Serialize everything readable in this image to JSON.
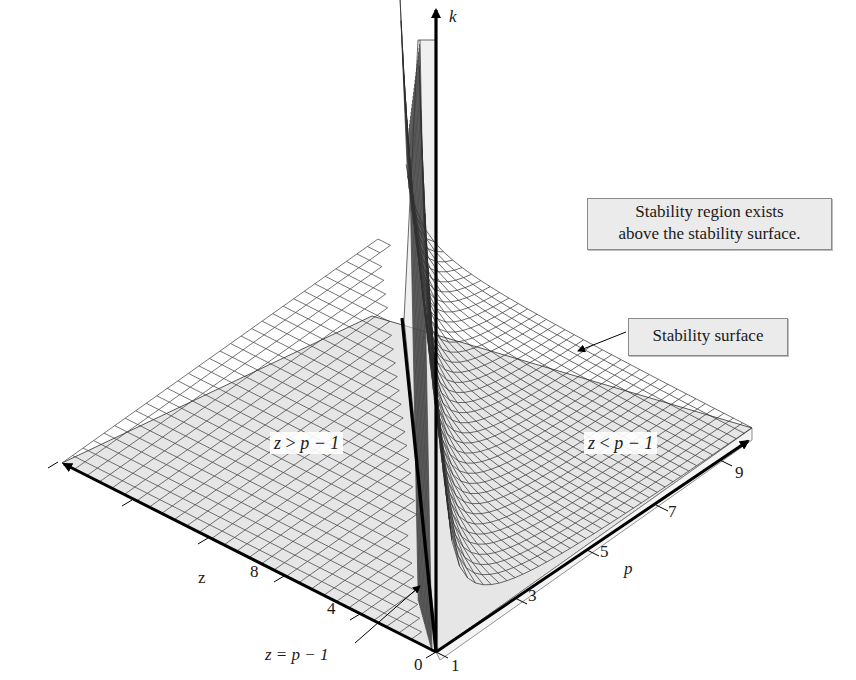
{
  "chart_data": {
    "type": "surface3d",
    "title": "",
    "axes": {
      "k": {
        "label": "k",
        "direction": "vertical",
        "ticks": []
      },
      "z": {
        "label": "z",
        "ticks": [
          "0",
          "2",
          "4",
          "6",
          "8",
          "10"
        ],
        "range": [
          0,
          10
        ]
      },
      "p": {
        "label": "p",
        "ticks": [
          "1",
          "3",
          "5",
          "7",
          "9"
        ],
        "range": [
          1,
          10
        ]
      }
    },
    "surface": {
      "name": "Stability surface",
      "ridge_line": "z = p - 1",
      "fill_color": "#e6e6e6",
      "grid_color": "#333333"
    },
    "regions": [
      {
        "label_lhs": "z",
        "label_op": ">",
        "label_rhs": "p − 1"
      },
      {
        "label_lhs": "z",
        "label_op": "<",
        "label_rhs": "p − 1"
      }
    ],
    "annotations": [
      {
        "text_line1": "Stability region exists",
        "text_line2": "above the stability surface."
      },
      {
        "text": "Stability surface"
      },
      {
        "text": "z = p − 1"
      }
    ],
    "grid": true,
    "legend": null
  },
  "labels": {
    "k_axis": "k",
    "z_axis": "z",
    "p_axis": "p",
    "z_ticks": [
      "0",
      "2",
      "4",
      "6",
      "8",
      "10"
    ],
    "p_ticks": [
      "1",
      "3",
      "5",
      "7",
      "9"
    ],
    "region_left": {
      "lhs": "z",
      "op": ">",
      "rhs": "p − 1"
    },
    "region_right": {
      "lhs": "z",
      "op": "<",
      "rhs": "p − 1"
    },
    "callout_region_line1": "Stability region exists",
    "callout_region_line2": "above the stability surface.",
    "callout_surface": "Stability surface",
    "callout_ridge": "z = p − 1"
  },
  "colors": {
    "surface_fill": "#e6e6e6",
    "grid_line": "#333333",
    "axis": "#000000",
    "callout_bg": "#ebebeb",
    "callout_border": "#8a8a8a"
  }
}
